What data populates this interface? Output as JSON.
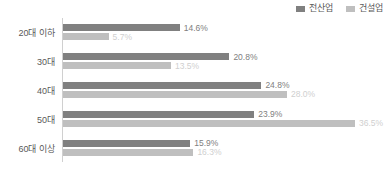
{
  "chart_data": {
    "type": "bar",
    "orientation": "horizontal",
    "title": "",
    "subtitle": "",
    "xlabel": "",
    "ylabel": "",
    "grid": false,
    "legend_position": "top-right",
    "xlim": [
      0,
      40
    ],
    "value_suffix": "%",
    "categories": [
      "20대 이하",
      "30대",
      "40대",
      "50대",
      "60대 이상"
    ],
    "series": [
      {
        "name": "전산업",
        "color": "#808080",
        "values": [
          14.6,
          20.8,
          24.8,
          23.9,
          15.9
        ],
        "labels": [
          "14.6%",
          "20.8%",
          "24.8%",
          "23.9%",
          "15.9%"
        ]
      },
      {
        "name": "건설업",
        "color": "#bfbfbf",
        "values": [
          5.7,
          13.5,
          28.0,
          36.5,
          16.3
        ],
        "labels": [
          "5.7%",
          "13.5%",
          "28.0%",
          "36.5%",
          "16.3%"
        ]
      }
    ]
  },
  "legend": {
    "items": [
      {
        "label": "전산업",
        "color": "#808080"
      },
      {
        "label": "건설업",
        "color": "#bfbfbf"
      }
    ]
  },
  "axis": {
    "category_labels": [
      "20대 이하",
      "30대",
      "40대",
      "50대",
      "60대 이상"
    ]
  }
}
